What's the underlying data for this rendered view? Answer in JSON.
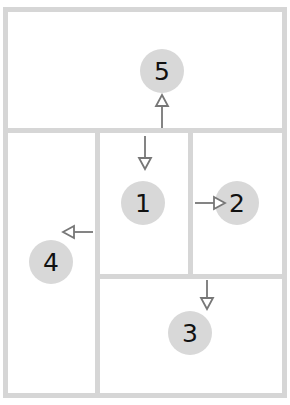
{
  "diagram": {
    "type": "layout-order",
    "colors": {
      "wall": "#d6d6d6",
      "circle": "#d8d8d8",
      "arrow": "#777777",
      "text": "#111111"
    },
    "regions": [
      {
        "id": "r1",
        "label": "1",
        "description": "center-top panel"
      },
      {
        "id": "r2",
        "label": "2",
        "description": "right-top panel"
      },
      {
        "id": "r3",
        "label": "3",
        "description": "bottom-right panel"
      },
      {
        "id": "r4",
        "label": "4",
        "description": "left column"
      },
      {
        "id": "r5",
        "label": "5",
        "description": "top banner"
      }
    ],
    "arrows": [
      {
        "from": "divider",
        "to": "5",
        "direction": "up"
      },
      {
        "from": "divider",
        "to": "1",
        "direction": "down"
      },
      {
        "from": "1",
        "to": "2",
        "direction": "right"
      },
      {
        "from": "divider",
        "to": "3",
        "direction": "down"
      },
      {
        "from": "divider",
        "to": "4",
        "direction": "left"
      }
    ]
  }
}
